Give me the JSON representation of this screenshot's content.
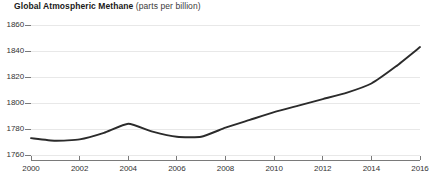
{
  "title": {
    "main": "Global Atmospheric Methane",
    "sub": " (parts per billion)"
  },
  "colors": {
    "line": "#2b2b2b",
    "grid": "#e8e8e8",
    "axis": "#7a7a7a",
    "text": "#333333"
  },
  "chart_data": {
    "type": "line",
    "title": "Global Atmospheric Methane (parts per billion)",
    "xlabel": "",
    "ylabel": "parts per billion",
    "xlim": [
      2000,
      2016
    ],
    "ylim": [
      1750,
      1862
    ],
    "grid": true,
    "legend": "none",
    "yticks": [
      1860,
      1840,
      1820,
      1800,
      1780,
      1760
    ],
    "ytick_labels": [
      "1860",
      "1840",
      "1820",
      "1800",
      "1780",
      "1760"
    ],
    "xticks": [
      2000,
      2002,
      2004,
      2006,
      2008,
      2010,
      2012,
      2014,
      2016
    ],
    "xtick_labels": [
      "2000",
      "2002",
      "2004",
      "2006",
      "2008",
      "2010",
      "2012",
      "2014",
      "2016"
    ],
    "series": [
      {
        "name": "Global Atmospheric Methane",
        "x": [
          2000,
          2001,
          2002,
          2003,
          2004,
          2005,
          2006,
          2007,
          2008,
          2009,
          2010,
          2011,
          2012,
          2013,
          2014,
          2015,
          2016
        ],
        "values": [
          1773,
          1771,
          1772,
          1777,
          1784,
          1778,
          1774,
          1774,
          1781,
          1787,
          1793,
          1798,
          1803,
          1808,
          1815,
          1828,
          1843
        ]
      }
    ]
  }
}
